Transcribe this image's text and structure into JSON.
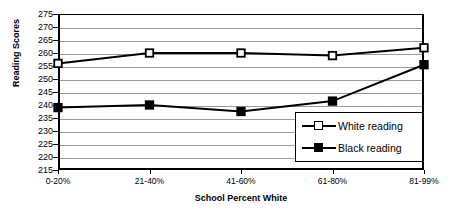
{
  "chart_data": {
    "type": "line",
    "title": "",
    "xlabel": "School Percent White",
    "ylabel": "Reading Scores",
    "categories": [
      "0-20%",
      "21-40%",
      "41-60%",
      "61-80%",
      "81-99%"
    ],
    "series": [
      {
        "name": "White reading",
        "marker": "open-square",
        "color": "#000000",
        "values": [
          256,
          260,
          260,
          259,
          262
        ]
      },
      {
        "name": "Black reading",
        "marker": "filled-square",
        "color": "#000000",
        "values": [
          239,
          240,
          237.5,
          241.5,
          255.5
        ]
      }
    ],
    "yticks": [
      275,
      270,
      265,
      260,
      255,
      250,
      245,
      240,
      235,
      230,
      225,
      220,
      215
    ],
    "ylim": [
      215,
      275
    ],
    "grid": true,
    "grid_color": "#9a9a9a",
    "legend_position": "inside-bottom-right",
    "legend_entries": [
      "White reading",
      "Black reading"
    ]
  }
}
